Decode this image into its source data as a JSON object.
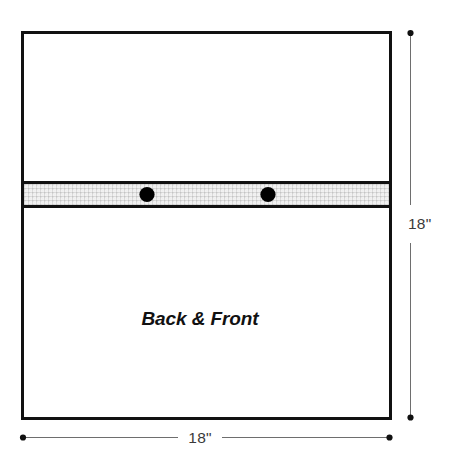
{
  "diagram": {
    "type": "sewing-pattern-cut-diagram",
    "units": "inches",
    "panel": {
      "label": "Back & Front",
      "fill_color": "#ffffff",
      "outline_color": "#111111",
      "outline_width_px": 3,
      "width_in": 18,
      "height_in": 18
    },
    "band": {
      "name": "mesh-band",
      "label": "",
      "fill_color": "#eeeeee",
      "texture": "fine-grid-stipple",
      "edge_color": "#111111"
    },
    "markers": [
      {
        "name": "grommet-left",
        "shape": "circle",
        "color": "#000000"
      },
      {
        "name": "grommet-right",
        "shape": "circle",
        "color": "#000000"
      }
    ],
    "dimensions": {
      "vertical": {
        "label": "18\"",
        "orientation": "vertical",
        "terminator": "dot",
        "line_color": "#6e6e6e"
      },
      "horizontal": {
        "label": "18\"",
        "orientation": "horizontal",
        "terminator": "dot",
        "line_color": "#6e6e6e"
      }
    }
  }
}
